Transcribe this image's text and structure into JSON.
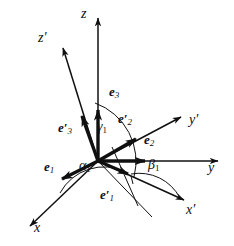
{
  "figure": {
    "background_color": "#ffffff",
    "stroke_color": "#101010",
    "axes": [
      {
        "name": "z",
        "label": "z",
        "primed": false,
        "x": 84,
        "y": 14,
        "tip_x": 98,
        "tip_y": 9,
        "origin_x": 98,
        "origin_y": 161
      },
      {
        "name": "y",
        "label": "y",
        "primed": false,
        "x": 210,
        "y": 168,
        "tip_x": 228,
        "tip_y": 160,
        "origin_x": 98,
        "origin_y": 161
      },
      {
        "name": "x",
        "label": "x",
        "primed": false,
        "x": 35,
        "y": 228,
        "tip_x": 22,
        "tip_y": 229,
        "origin_x": 98,
        "origin_y": 161
      },
      {
        "name": "z-prime",
        "label": "z",
        "primed": true,
        "x": 41,
        "y": 38,
        "tip_x": 63,
        "tip_y": 40,
        "origin_x": 98,
        "origin_y": 161
      },
      {
        "name": "y-prime",
        "label": "y",
        "primed": true,
        "x": 191,
        "y": 120,
        "tip_x": 185,
        "tip_y": 110,
        "origin_x": 98,
        "origin_y": 161
      },
      {
        "name": "x-prime",
        "label": "x",
        "primed": true,
        "x": 188,
        "y": 210,
        "tip_x": 190,
        "tip_y": 201,
        "origin_x": 98,
        "origin_y": 161
      }
    ],
    "unit_vectors": [
      {
        "name": "e1",
        "base": "e",
        "index": "1",
        "primed": false,
        "x": 48,
        "y": 166,
        "tip_x": 64,
        "tip_y": 182
      },
      {
        "name": "e2",
        "base": "e",
        "index": "2",
        "primed": false,
        "x": 148,
        "y": 140,
        "tip_x": 152,
        "tip_y": 160
      },
      {
        "name": "e3",
        "base": "e",
        "index": "3",
        "primed": false,
        "x": 112,
        "y": 91,
        "tip_x": 98,
        "tip_y": 106
      },
      {
        "name": "e1-prime",
        "base": "e",
        "index": "1",
        "primed": true,
        "x": 104,
        "y": 193,
        "tip_x": 133,
        "tip_y": 172
      },
      {
        "name": "e2-prime",
        "base": "e",
        "index": "2",
        "primed": true,
        "x": 121,
        "y": 118,
        "tip_x": 143,
        "tip_y": 134
      },
      {
        "name": "e3-prime",
        "base": "e",
        "index": "3",
        "primed": true,
        "x": 62,
        "y": 127,
        "tip_x": 85,
        "tip_y": 112
      }
    ],
    "angles": [
      {
        "name": "alpha1",
        "symbol": "α",
        "index": "1",
        "x": 82,
        "y": 166,
        "between": [
          "e1-prime",
          "x-axis"
        ]
      },
      {
        "name": "beta1",
        "symbol": "β",
        "index": "1",
        "x": 150,
        "y": 165,
        "between": [
          "e1-prime",
          "y-axis"
        ]
      },
      {
        "name": "gamma1",
        "symbol": "γ",
        "index": "1",
        "x": 99,
        "y": 127,
        "between": [
          "e1-prime",
          "z-axis"
        ]
      }
    ],
    "origin": {
      "x": 98,
      "y": 161,
      "label": ""
    }
  }
}
